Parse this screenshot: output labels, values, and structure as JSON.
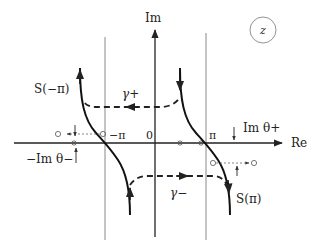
{
  "diagram": {
    "plane_label": "z",
    "axes": {
      "real_label": "Re",
      "imag_label": "Im"
    },
    "tick_labels": {
      "origin": "0",
      "minus_pi": "−π",
      "plus_pi": "π"
    },
    "curves": {
      "left": "S(−π)",
      "right": "S(π)"
    },
    "contours": {
      "upper": "γ+",
      "lower": "γ−"
    },
    "annotations": {
      "im_theta_plus": "Im θ+",
      "minus_im_theta_minus": "−Im θ−"
    },
    "colors": {
      "ink": "#222222",
      "grid": "#888888",
      "dotted": "#666666"
    }
  }
}
